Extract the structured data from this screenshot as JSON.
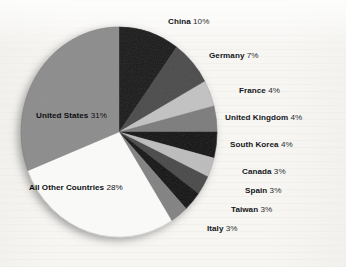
{
  "chart_data": {
    "type": "pie",
    "title": "",
    "subtitle": "",
    "xlabel": "",
    "ylabel": "",
    "legend_position": "none",
    "grid": false,
    "value_unit": "percent",
    "label_format": "{name} {value}%",
    "start_angle_deg": 0,
    "direction": "clockwise",
    "total": 100,
    "categories": [
      "China",
      "Germany",
      "France",
      "United Kingdom",
      "South Korea",
      "Canada",
      "Spain",
      "Taiwan",
      "Italy",
      "All Other Countries",
      "United States"
    ],
    "values": [
      10,
      7,
      4,
      4,
      4,
      3,
      3,
      3,
      3,
      28,
      31
    ],
    "slices": [
      {
        "name": "China",
        "value": 10,
        "value_text": "10%",
        "color": "#131313",
        "label_side": "top"
      },
      {
        "name": "Germany",
        "value": 7,
        "value_text": "7%",
        "color": "#4c4c4c",
        "label_side": "right"
      },
      {
        "name": "France",
        "value": 4,
        "value_text": "4%",
        "color": "#c2c2c2",
        "label_side": "right"
      },
      {
        "name": "United Kingdom",
        "value": 4,
        "value_text": "4%",
        "color": "#7d7d7d",
        "label_side": "right"
      },
      {
        "name": "South Korea",
        "value": 4,
        "value_text": "4%",
        "color": "#0d0d0d",
        "label_side": "right"
      },
      {
        "name": "Canada",
        "value": 3,
        "value_text": "3%",
        "color": "#bdbdbd",
        "label_side": "right"
      },
      {
        "name": "Spain",
        "value": 3,
        "value_text": "3%",
        "color": "#4a4a4a",
        "label_side": "right"
      },
      {
        "name": "Taiwan",
        "value": 3,
        "value_text": "3%",
        "color": "#101010",
        "label_side": "right"
      },
      {
        "name": "Italy",
        "value": 3,
        "value_text": "3%",
        "color": "#838383",
        "label_side": "right"
      },
      {
        "name": "All Other Countries",
        "value": 28,
        "value_text": "28%",
        "color": "#fbfbf9",
        "label_side": "inside"
      },
      {
        "name": "United States",
        "value": 31,
        "value_text": "31%",
        "color": "#8d8d8d",
        "label_side": "inside"
      }
    ]
  },
  "labels": {
    "china": {
      "name": "China",
      "value": "10%"
    },
    "germany": {
      "name": "Germany",
      "value": "7%"
    },
    "france": {
      "name": "France",
      "value": "4%"
    },
    "united_kingdom": {
      "name": "United Kingdom",
      "value": "4%"
    },
    "south_korea": {
      "name": "South Korea",
      "value": "4%"
    },
    "canada": {
      "name": "Canada",
      "value": "3%"
    },
    "spain": {
      "name": "Spain",
      "value": "3%"
    },
    "taiwan": {
      "name": "Taiwan",
      "value": "3%"
    },
    "italy": {
      "name": "Italy",
      "value": "3%"
    },
    "united_states": {
      "name": "United States",
      "value": "31%"
    },
    "all_other": {
      "name": "All Other Countries",
      "value": "28%"
    }
  },
  "geometry": {
    "cx": 119,
    "cy": 132,
    "rx": 98,
    "ry": 105
  },
  "colors": {
    "background": "#f6f6f4",
    "text": "#15161a",
    "shadow": "rgba(60,60,60,0.38)"
  }
}
